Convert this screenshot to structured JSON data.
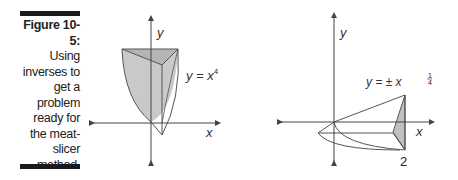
{
  "figure": {
    "number_label": "Figure 10-5:",
    "caption_lines": [
      "Using",
      "inverses to",
      "get a",
      "problem",
      "ready for",
      "the meat-",
      "slicer",
      "method."
    ]
  },
  "left_graph": {
    "x_axis_label": "x",
    "y_axis_label": "y",
    "equation_base": "y = x",
    "equation_exponent": "4",
    "fill_color": "#c8c8c8",
    "line_color": "#555555"
  },
  "right_graph": {
    "x_axis_label": "x",
    "y_axis_label": "y",
    "equation_base": "y = ± x",
    "equation_exponent_num": "1",
    "equation_exponent_den": "4",
    "x_tick_label": "2",
    "fill_color": "#c8c8c8",
    "line_color": "#555555"
  }
}
